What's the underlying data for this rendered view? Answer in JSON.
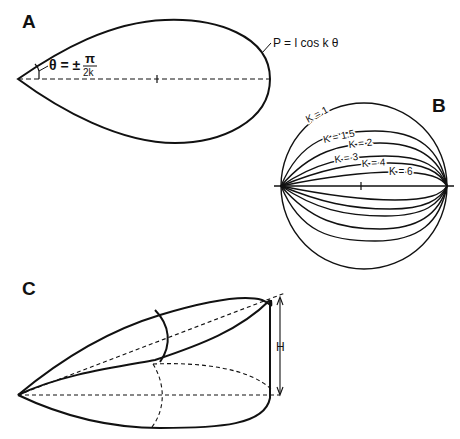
{
  "panels": {
    "a": {
      "label": "A",
      "angle_lhs": "θ = ±",
      "angle_num": "π",
      "angle_den": "2k",
      "length_label": "l",
      "equation": "P = l cos k θ"
    },
    "b": {
      "label": "B",
      "length_label": "l",
      "curves": [
        "K = 1",
        "K = 1.5",
        "K = 2",
        "K = 3",
        "K = 4",
        "K = 6"
      ]
    },
    "c": {
      "label": "C",
      "height_label": "H"
    }
  },
  "colors": {
    "stroke": "#111111",
    "background": "#ffffff"
  }
}
